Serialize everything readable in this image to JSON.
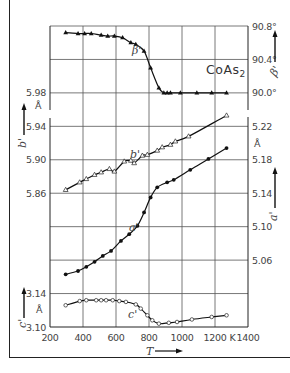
{
  "chart_data": {
    "type": "line",
    "title": "CoAs2",
    "xlabel": "T",
    "x_unit": "K",
    "xlim": [
      200,
      1400
    ],
    "x_ticks": [
      "200",
      "400",
      "600",
      "800",
      "1000",
      "1200",
      "K",
      "1400"
    ],
    "grid": true,
    "axes": {
      "left_upper": {
        "label": "b'",
        "unit": "Å",
        "ticks": [
          "5.98",
          "5.94",
          "5.90",
          "5.86"
        ],
        "range": [
          5.82,
          5.98
        ]
      },
      "left_lower": {
        "label": "c'",
        "unit": "Å",
        "ticks": [
          "3.14",
          "3.10"
        ],
        "range": [
          3.1,
          3.14
        ]
      },
      "right_upper": {
        "label": "β'",
        "unit": "°",
        "ticks": [
          "90.8°",
          "90.4°",
          "90.0°"
        ],
        "range": [
          90.0,
          90.8
        ]
      },
      "right_lower": {
        "label": "a'",
        "unit": "Å",
        "ticks": [
          "5.22",
          "5.18",
          "5.14",
          "5.10",
          "5.06"
        ],
        "range": [
          5.02,
          5.22
        ]
      }
    },
    "series": [
      {
        "name": "β'",
        "axis": "right_upper",
        "marker": "filled-triangle",
        "x": [
          295,
          370,
          410,
          450,
          510,
          550,
          590,
          640,
          690,
          720,
          770,
          810,
          860,
          890,
          910,
          930,
          990,
          1090,
          1180,
          1270
        ],
        "values": [
          90.72,
          90.71,
          90.71,
          90.71,
          90.69,
          90.68,
          90.68,
          90.66,
          90.6,
          90.58,
          90.5,
          90.3,
          90.06,
          90.0,
          90.0,
          90.0,
          90.0,
          90.0,
          90.0,
          90.0
        ]
      },
      {
        "name": "b'",
        "axis": "left_upper",
        "marker": "open-triangle",
        "x": [
          295,
          380,
          420,
          470,
          510,
          560,
          590,
          650,
          690,
          710,
          760,
          790,
          850,
          880,
          930,
          960,
          1040,
          1270
        ],
        "values": [
          5.864,
          5.873,
          5.877,
          5.882,
          5.885,
          5.889,
          5.886,
          5.898,
          5.899,
          5.896,
          5.905,
          5.906,
          5.911,
          5.915,
          5.918,
          5.922,
          5.928,
          5.953
        ]
      },
      {
        "name": "a'",
        "axis": "right_lower",
        "marker": "filled-circle",
        "x": [
          295,
          370,
          420,
          470,
          520,
          570,
          630,
          680,
          730,
          770,
          810,
          850,
          910,
          950,
          1050,
          1160,
          1270
        ],
        "values": [
          5.043,
          5.047,
          5.052,
          5.058,
          5.065,
          5.071,
          5.083,
          5.091,
          5.101,
          5.117,
          5.135,
          5.147,
          5.153,
          5.156,
          5.168,
          5.181,
          5.194
        ]
      },
      {
        "name": "c'",
        "axis": "left_lower",
        "marker": "open-circle",
        "x": [
          295,
          380,
          420,
          480,
          510,
          540,
          580,
          620,
          660,
          720,
          750,
          790,
          820,
          860,
          920,
          970,
          1060,
          1180,
          1270
        ],
        "values": [
          3.126,
          3.131,
          3.132,
          3.132,
          3.132,
          3.132,
          3.132,
          3.131,
          3.13,
          3.127,
          3.122,
          3.114,
          3.108,
          3.104,
          3.105,
          3.106,
          3.109,
          3.112,
          3.114
        ]
      }
    ]
  },
  "labels": {
    "title": "CoAs",
    "title_sub": "2",
    "x_axis": "T",
    "x_unit": "K",
    "b_prime": "b'",
    "a_prime": "a'",
    "c_prime": "c'",
    "beta_prime": "β'",
    "angstrom": "Å"
  },
  "ticks": {
    "x": [
      "200",
      "400",
      "600",
      "800",
      "1000",
      "1200",
      "1400"
    ],
    "left_b": [
      "5.98",
      "5.94",
      "5.90",
      "5.86"
    ],
    "left_c": [
      "3.14",
      "3.10"
    ],
    "right_beta": [
      "90.8°",
      "90.4°",
      "90.0°"
    ],
    "right_a": [
      "5.22",
      "5.18",
      "5.14",
      "5.10",
      "5.06"
    ]
  }
}
